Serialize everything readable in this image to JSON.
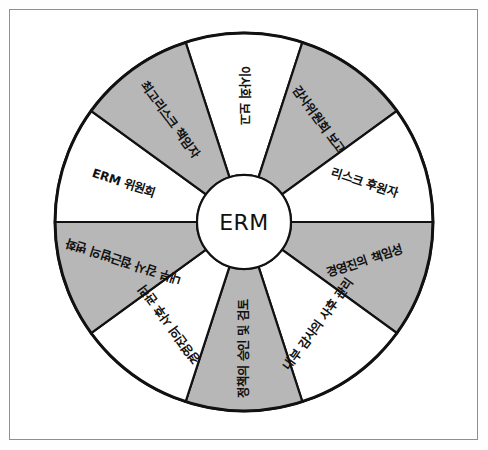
{
  "figure": {
    "type": "radial-wheel-diagram",
    "hub_label": "ERM",
    "segment_count": 10,
    "colors": {
      "fill_shaded": "#b7b7b7",
      "fill_plain": "#ffffff",
      "stroke": "#111111",
      "frame_border": "#8f8f8f",
      "page_background": "#ffffff",
      "text": "#111111"
    },
    "geometry": {
      "center_x": 244,
      "center_y": 222,
      "outer_radius": 189,
      "hub_radius": 47,
      "start_angle_deg": -108,
      "sweep_per_segment_deg": 36
    }
  },
  "segments": [
    {
      "index": 0,
      "label": "이사회 보고",
      "shaded": false,
      "mid_angle_deg": -90,
      "text_rotation_deg": 90
    },
    {
      "index": 1,
      "label": "감사위원회 보고",
      "shaded": true,
      "mid_angle_deg": -54,
      "text_rotation_deg": 54
    },
    {
      "index": 2,
      "label": "리스크 후원자",
      "shaded": false,
      "mid_angle_deg": -18,
      "text_rotation_deg": 18
    },
    {
      "index": 3,
      "label": "경영진의 책임성",
      "shaded": true,
      "mid_angle_deg": 18,
      "text_rotation_deg": -18
    },
    {
      "index": 4,
      "label": "내부 감사의 사후 관리",
      "shaded": false,
      "mid_angle_deg": 54,
      "text_rotation_deg": -54
    },
    {
      "index": 5,
      "label": "정책의 승인 및 검토",
      "shaded": true,
      "mid_angle_deg": 90,
      "text_rotation_deg": -90
    },
    {
      "index": 6,
      "label": "경영진의 사후 관리",
      "shaded": false,
      "mid_angle_deg": 126,
      "text_rotation_deg": -126
    },
    {
      "index": 7,
      "label": "내부 감사 접근법의 변화",
      "shaded": true,
      "mid_angle_deg": 162,
      "text_rotation_deg": -162
    },
    {
      "index": 8,
      "label": "ERM 위원회",
      "shaded": false,
      "mid_angle_deg": 198,
      "text_rotation_deg": 18
    },
    {
      "index": 9,
      "label": "최고리스크 책임자",
      "shaded": true,
      "mid_angle_deg": 234,
      "text_rotation_deg": 54
    }
  ]
}
